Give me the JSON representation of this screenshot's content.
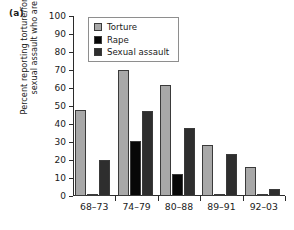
{
  "panel_label": "(a)",
  "colors": {
    "torture": "#a8a8a8",
    "rape": "#070707",
    "sexual_assault": "#2e2e2e",
    "axis": "#2b2b2b",
    "legend_border": "#8e8e8e",
    "background": "#ffffff"
  },
  "legend": {
    "position": "top-left-inside",
    "items": [
      {
        "label": "Torture",
        "color": "#a8a8a8",
        "swatch_name": "legend-swatch-torture"
      },
      {
        "label": "Rape",
        "color": "#070707",
        "swatch_name": "legend-swatch-rape"
      },
      {
        "label": "Sexual assault",
        "color": "#2e2e2e",
        "swatch_name": "legend-swatch-sexual-assault"
      }
    ]
  },
  "chart_data": {
    "type": "bar",
    "title": "",
    "subtitle": "",
    "xlabel": "",
    "ylabel": "Percent reporting torture/forcible rape/\nsexual assault who are Kurds",
    "categories": [
      "68–73",
      "74–79",
      "80–88",
      "89–91",
      "92–03"
    ],
    "series": [
      {
        "name": "Torture",
        "color": "#a8a8a8",
        "values": [
          48,
          70,
          61.5,
          28.5,
          16
        ]
      },
      {
        "name": "Rape",
        "color": "#070707",
        "values": [
          0.6,
          30.5,
          12,
          0.5,
          0.3
        ]
      },
      {
        "name": "Sexual assault",
        "color": "#2e2e2e",
        "values": [
          19.8,
          47,
          38,
          23.5,
          4
        ]
      }
    ],
    "ylim": [
      0,
      100
    ],
    "yticks": [
      0,
      10,
      20,
      30,
      40,
      50,
      60,
      70,
      80,
      90,
      100
    ],
    "ytick_labels": [
      "0",
      "10",
      "20",
      "30",
      "40",
      "50",
      "60",
      "70",
      "80",
      "90",
      "100"
    ],
    "grid": false,
    "legend_position": "upper left"
  }
}
